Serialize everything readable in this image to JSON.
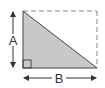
{
  "diagram": {
    "labels": {
      "vertical_leg": "A",
      "horizontal_leg": "B"
    },
    "shapes": {
      "triangle": {
        "vertices": [
          [
            23,
            11
          ],
          [
            23,
            68
          ],
          [
            97,
            68
          ]
        ],
        "fill": "#c8c8c8",
        "stroke": "#444444"
      },
      "dashed_rectangle": {
        "x": 23,
        "y": 11,
        "width": 74,
        "height": 57,
        "stroke": "#888888"
      },
      "right_angle_marker": {
        "x": 23,
        "y": 60,
        "size": 8
      }
    },
    "arrows": {
      "vertical": {
        "x": 13,
        "y1": 11,
        "y2": 68,
        "label": "A"
      },
      "horizontal": {
        "y": 78,
        "x1": 23,
        "x2": 97,
        "label": "B"
      }
    },
    "colors": {
      "background": "#ffffff",
      "triangle_fill": "#c8c8c8",
      "line": "#444444",
      "dash": "#888888"
    }
  }
}
